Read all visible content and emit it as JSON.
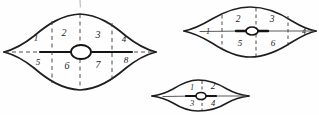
{
  "figure": {
    "background_color": "#fefefe",
    "ink_color": "#1c1c1c",
    "stroke_color": "#222222",
    "dash_color": "#3a3a3a",
    "shapes": [
      {
        "id": "large-lens",
        "name": "large-lens-figure",
        "sector_count": 8,
        "center_node": "open-ellipse",
        "labels": [
          {
            "key": "s1",
            "text": "1",
            "x": 36,
            "y": 41,
            "size": 9
          },
          {
            "key": "s2",
            "text": "2",
            "x": 64,
            "y": 36,
            "size": 10
          },
          {
            "key": "s3",
            "text": "3",
            "x": 98,
            "y": 38,
            "size": 10
          },
          {
            "key": "s4",
            "text": "4",
            "x": 124,
            "y": 42,
            "size": 9
          },
          {
            "key": "s5",
            "text": "5",
            "x": 38,
            "y": 65,
            "size": 9
          },
          {
            "key": "s6",
            "text": "6",
            "x": 67,
            "y": 69,
            "size": 10
          },
          {
            "key": "s7",
            "text": "7",
            "x": 98,
            "y": 68,
            "size": 10
          },
          {
            "key": "s8",
            "text": "8",
            "x": 126,
            "y": 63,
            "size": 9
          }
        ]
      },
      {
        "id": "mid-lens",
        "name": "medium-lens-figure",
        "sector_count": 6,
        "center_node": "filled-ellipse",
        "labels": [
          {
            "key": "m1",
            "text": "1",
            "x": 208,
            "y": 32,
            "size": 8
          },
          {
            "key": "m2",
            "text": "2",
            "x": 238,
            "y": 19,
            "size": 9
          },
          {
            "key": "m3",
            "text": "3",
            "x": 272,
            "y": 20,
            "size": 9
          },
          {
            "key": "m4",
            "text": "4",
            "x": 303,
            "y": 32,
            "size": 8
          },
          {
            "key": "m5",
            "text": "5",
            "x": 240,
            "y": 44,
            "size": 9
          },
          {
            "key": "m6",
            "text": "6",
            "x": 272,
            "y": 44,
            "size": 9
          }
        ]
      },
      {
        "id": "small-lens",
        "name": "small-lens-figure",
        "sector_count": 4,
        "center_node": "small-open-ellipse",
        "labels": [
          {
            "key": "t1",
            "text": "1",
            "x": 192,
            "y": 88,
            "size": 7
          },
          {
            "key": "t2",
            "text": "2",
            "x": 212,
            "y": 86,
            "size": 9
          },
          {
            "key": "t3",
            "text": "3",
            "x": 193,
            "y": 103,
            "size": 8
          },
          {
            "key": "t4",
            "text": "4",
            "x": 213,
            "y": 103,
            "size": 8
          }
        ]
      }
    ],
    "stray_marks": [
      {
        "key": "top-tick",
        "description": "faint vertical tick above large lens"
      }
    ]
  }
}
